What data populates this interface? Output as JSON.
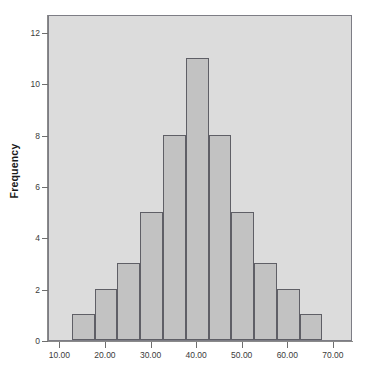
{
  "chart_data": {
    "type": "bar",
    "title": "",
    "subtitle": "",
    "xlabel": "",
    "ylabel": "Frequency",
    "grid": false,
    "legend": null,
    "bin_width": 5,
    "bin_starts": [
      12.5,
      17.5,
      22.5,
      27.5,
      32.5,
      37.5,
      42.5,
      47.5,
      52.5,
      57.5,
      62.5
    ],
    "categories": [
      "12.5-17.5",
      "17.5-22.5",
      "22.5-27.5",
      "27.5-32.5",
      "32.5-37.5",
      "37.5-42.5",
      "42.5-47.5",
      "47.5-52.5",
      "52.5-57.5",
      "57.5-62.5",
      "62.5-67.5"
    ],
    "values": [
      1,
      2,
      3,
      5,
      8,
      11,
      8,
      5,
      3,
      2,
      1
    ],
    "xlim": [
      7.5,
      74.2
    ],
    "ylim": [
      0,
      12.7
    ],
    "xticks": [
      10,
      20,
      30,
      40,
      50,
      60,
      70
    ],
    "xtick_labels": [
      "10.00",
      "20.00",
      "30.00",
      "40.00",
      "50.00",
      "60.00",
      "70.00"
    ],
    "yticks": [
      0,
      2,
      4,
      6,
      8,
      10,
      12
    ],
    "ytick_labels": [
      "0",
      "2",
      "4",
      "6",
      "8",
      "10",
      "12"
    ],
    "colors": {
      "bar_fill": "#c2c2c2",
      "bar_border": "#5f5f66",
      "plot_background": "#dcdcdc",
      "figure_background": "#ffffff",
      "axis": "#8a8a8a",
      "tick_text": "#3b3b3b",
      "axis_title_text": "#1a1a1a"
    }
  }
}
